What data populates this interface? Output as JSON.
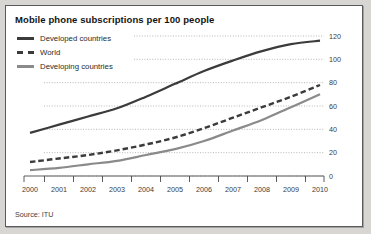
{
  "panel": {
    "title": "Mobile phone subscriptions per 100 people",
    "source": "Source: ITU"
  },
  "legend": {
    "position": "top-left",
    "items": [
      {
        "label": "Developed countries",
        "style": "solid",
        "color": "#3b3b3b"
      },
      {
        "label": "World",
        "style": "dashed",
        "color": "#3b3b3b"
      },
      {
        "label": "Developing countries",
        "style": "solid",
        "color": "#8a8a8a"
      }
    ]
  },
  "chart_data": {
    "type": "line",
    "title": "Mobile phone subscriptions per 100 people",
    "xlabel": "",
    "ylabel": "",
    "x": [
      2000,
      2001,
      2002,
      2003,
      2004,
      2005,
      2006,
      2007,
      2008,
      2009,
      2010
    ],
    "categories": [
      "2000",
      "2001",
      "2002",
      "2003",
      "2004",
      "2005",
      "2006",
      "2007",
      "2008",
      "2009",
      "2010"
    ],
    "xlim": [
      2000,
      2010
    ],
    "ylim": [
      0,
      120
    ],
    "yticks": [
      0,
      20,
      40,
      60,
      80,
      100,
      120
    ],
    "yaxis_side": "right",
    "grid": true,
    "grid_style": "dotted",
    "series": [
      {
        "name": "Developed countries",
        "color": "#3b3b3b",
        "style": "solid",
        "values": [
          37,
          44,
          51,
          58,
          68,
          79,
          90,
          99,
          107,
          113,
          116
        ]
      },
      {
        "name": "World",
        "color": "#3b3b3b",
        "style": "dashed",
        "values": [
          12,
          15,
          18,
          22,
          27,
          33,
          41,
          50,
          59,
          68,
          78
        ]
      },
      {
        "name": "Developing countries",
        "color": "#8a8a8a",
        "style": "solid",
        "values": [
          5,
          7,
          10,
          13,
          18,
          23,
          30,
          39,
          48,
          59,
          70
        ]
      }
    ]
  },
  "axis": {
    "x_tick_labels": [
      "2000",
      "2001",
      "2002",
      "2003",
      "2004",
      "2005",
      "2006",
      "2007",
      "2008",
      "2009",
      "2010"
    ],
    "y_tick_labels": [
      "0",
      "20",
      "40",
      "60",
      "80",
      "100",
      "120"
    ]
  }
}
